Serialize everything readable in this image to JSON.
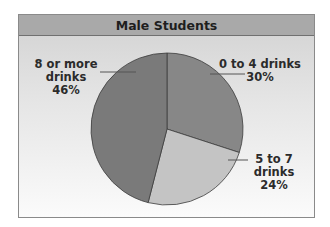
{
  "chart_data": {
    "type": "pie",
    "title": "Male Students",
    "categories": [
      "0 to 4 drinks",
      "5 to 7 drinks",
      "8 or more drinks"
    ],
    "values": [
      30,
      24,
      46
    ],
    "unit": "%",
    "labels": [
      {
        "line1": "0 to 4 drinks",
        "line2": "",
        "pct": "30%"
      },
      {
        "line1": "5 to 7",
        "line2": "drinks",
        "pct": "24%"
      },
      {
        "line1": "8 or more",
        "line2": "drinks",
        "pct": "46%"
      }
    ],
    "colors": [
      "#878787",
      "#c4c4c4",
      "#7a7a7a"
    ],
    "start_angle_deg": 0,
    "direction": "clockwise",
    "legend": "none (direct labels)"
  },
  "style": {
    "header_bg": "#a9a9a9",
    "slice_stroke": "#3c3c3c"
  }
}
